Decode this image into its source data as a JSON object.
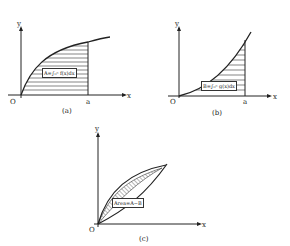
{
  "panels": [
    {
      "id": "a",
      "caption": "(a)",
      "y_label": "y",
      "x_label": "x",
      "origin": "O",
      "a_label": "a",
      "formula": "A=∫₀ᵃ f(x)dx"
    },
    {
      "id": "b",
      "caption": "(b)",
      "y_label": "y",
      "x_label": "x",
      "origin": "O",
      "a_label": "a",
      "formula": "B=∫₀ᵃ g(x)dx"
    },
    {
      "id": "c",
      "caption": "(c)",
      "y_label": "y",
      "x_label": "x",
      "origin": "O",
      "formula": "Area=A−B"
    }
  ]
}
